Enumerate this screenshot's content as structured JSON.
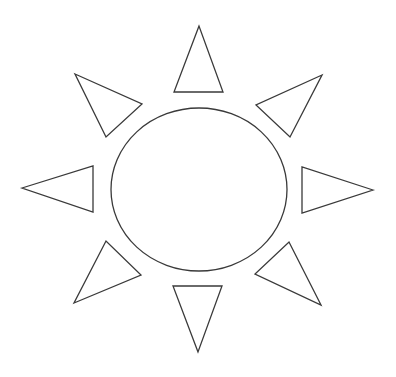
{
  "figure": {
    "background_color": "#ffffff",
    "stroke_color": "#3a3a3a",
    "stroke_width": 1.3,
    "sun_body": {
      "shape": "ellipse",
      "cx": 199,
      "cy": 189.5,
      "rx": 88,
      "ry": 81.5
    },
    "rays": [
      {
        "name": "ray-top",
        "points": "199,26 174,92 223,92"
      },
      {
        "name": "ray-top-right",
        "points": "322,75 256,105 290,137"
      },
      {
        "name": "ray-right",
        "points": "373,190 302,167 302,213"
      },
      {
        "name": "ray-bottom-right",
        "points": "321,305 289,242 255,274"
      },
      {
        "name": "ray-bottom",
        "points": "198,352 173,286 222,286"
      },
      {
        "name": "ray-bottom-left",
        "points": "74,303 141,275 106,241"
      },
      {
        "name": "ray-left",
        "points": "22,188 93,166 93,212"
      },
      {
        "name": "ray-top-left",
        "points": "75,74 142,104 106,137"
      }
    ]
  }
}
